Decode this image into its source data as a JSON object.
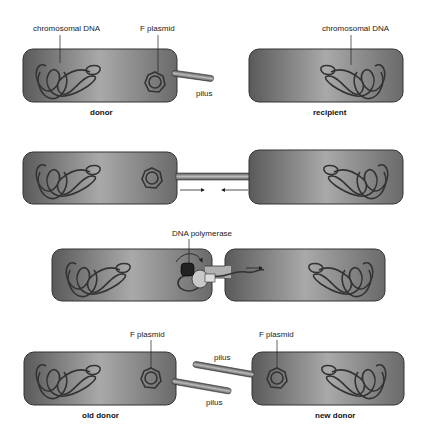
{
  "diagram": {
    "colors": {
      "cell_dark": "#5f5f5f",
      "cell_light": "#a8a8a8",
      "outline": "#333333",
      "dna": "#2b2b2b",
      "pilus": "#8a8a8a"
    },
    "stages": [
      {
        "id": "stage-1",
        "labels": {
          "chromosomal_dna_left": "chromosomal DNA",
          "f_plasmid": "F plasmid",
          "pilus": "pilus",
          "chromosomal_dna_right": "chromosomal DNA"
        },
        "captions": {
          "left": "donor",
          "right": "recipient"
        }
      },
      {
        "id": "stage-2",
        "arrows": [
          "right",
          "left"
        ]
      },
      {
        "id": "stage-3",
        "labels": {
          "enzyme": "DNA polymerase"
        },
        "arrows": [
          "right"
        ]
      },
      {
        "id": "stage-4",
        "labels": {
          "f_plasmid_left": "F plasmid",
          "f_plasmid_right": "F plasmid",
          "pilus_top": "pilus",
          "pilus_bottom": "pilus"
        },
        "captions": {
          "left": "old donor",
          "right": "new donor"
        }
      }
    ]
  }
}
